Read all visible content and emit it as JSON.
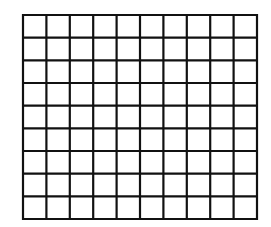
{
  "diagram": {
    "type": "grid",
    "columns": 10,
    "rows": 9,
    "bounds": {
      "left": 23,
      "top": 15,
      "right": 257,
      "bottom": 219
    },
    "line_color": "#111111",
    "line_width": 2.2,
    "background": "#ffffff"
  }
}
